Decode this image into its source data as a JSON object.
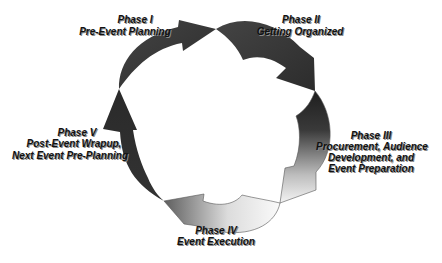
{
  "diagram": {
    "type": "cycle",
    "title": "",
    "phases": [
      {
        "id": "phase-1",
        "heading": "Phase I",
        "lines": [
          "Pre-Event Planning"
        ],
        "shade": "dark"
      },
      {
        "id": "phase-2",
        "heading": "Phase II",
        "lines": [
          "Getting Organized"
        ],
        "shade": "dark"
      },
      {
        "id": "phase-3",
        "heading": "Phase III",
        "lines": [
          "Procurement, Audience",
          "Development, and",
          "Event Preparation"
        ],
        "shade": "dark-to-light"
      },
      {
        "id": "phase-4",
        "heading": "Phase IV",
        "lines": [
          "Event Execution"
        ],
        "shade": "light-to-mid"
      },
      {
        "id": "phase-5",
        "heading": "Phase V",
        "lines": [
          "Post-Event Wrapup,",
          "Next Event Pre-Planning"
        ],
        "shade": "dark"
      }
    ],
    "flow": [
      "phase-1",
      "phase-2",
      "phase-3",
      "phase-4",
      "phase-5",
      "phase-1"
    ],
    "colors": {
      "dark": "#3a3a3a",
      "darker": "#262626",
      "mid": "#6e6e6e",
      "light": "#f2f2f2",
      "outline": "#555555",
      "text": "#111111"
    }
  }
}
